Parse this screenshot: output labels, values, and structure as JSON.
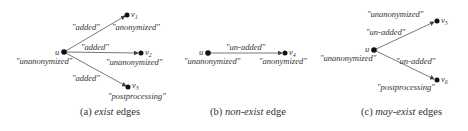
{
  "panels": [
    {
      "id": "a",
      "caption": {
        "prefix": "(a) ",
        "emph": "exist",
        "suffix": " edges"
      },
      "source": {
        "name": "u",
        "label": "\"unanonymized\""
      },
      "edges": [
        {
          "edge_label": "\"added\"",
          "target": "v",
          "sub": "1",
          "target_label": "\"anonymized\""
        },
        {
          "edge_label": "\"added\"",
          "target": "v",
          "sub": "2",
          "target_label": "\"unanonymized\""
        },
        {
          "edge_label": "\"added\"",
          "target": "v",
          "sub": "3",
          "target_label": "\"postprocessing\""
        }
      ]
    },
    {
      "id": "b",
      "caption": {
        "prefix": "(b) ",
        "emph": "non-exist",
        "suffix": " edge"
      },
      "source": {
        "name": "u",
        "label": "\"unanonymized\""
      },
      "edges": [
        {
          "edge_label": "\"un-added\"",
          "target": "v",
          "sub": "4",
          "target_label": "\"anonymized\""
        }
      ]
    },
    {
      "id": "c",
      "caption": {
        "prefix": "(c) ",
        "emph": "may-exist",
        "suffix": " edges"
      },
      "source": {
        "name": "u",
        "label": "\"unanonymized\""
      },
      "edges": [
        {
          "edge_label": "\"un-added\"",
          "target": "v",
          "sub": "5",
          "target_label": "\"unanonymized\""
        },
        {
          "edge_label": "\"un-added\"",
          "target": "v",
          "sub": "6",
          "target_label": "\"postprocessing\""
        }
      ]
    }
  ],
  "colors": {
    "node": "#111111",
    "edge": "#444444",
    "text": "#333333"
  }
}
